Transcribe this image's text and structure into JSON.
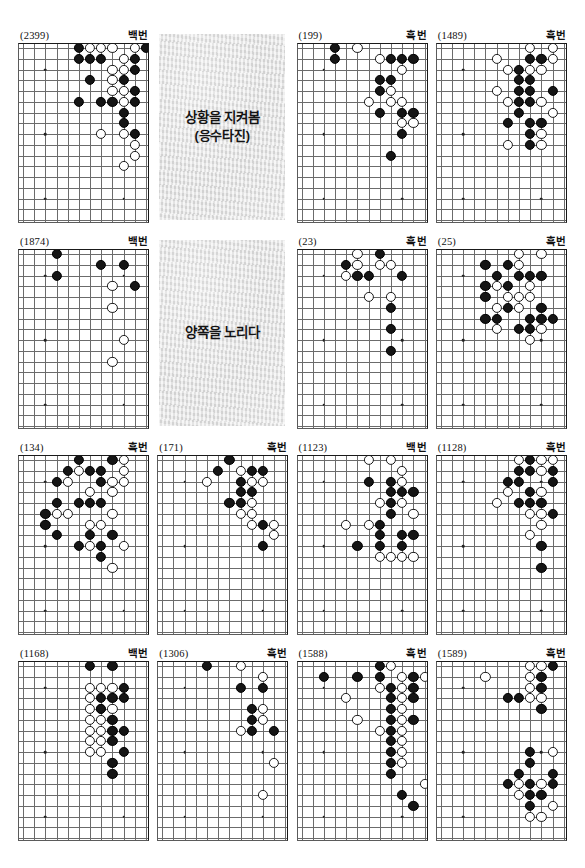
{
  "sheet": {
    "label_black_turn": "흑번",
    "label_white_turn": "백번",
    "board": {
      "cols": 12,
      "rows": 17
    }
  },
  "captions": [
    {
      "line1": "상황을 지켜봄",
      "line2": "(응수타진)"
    },
    {
      "line1": "양쪽을 노리다",
      "line2": ""
    }
  ],
  "panels": [
    {
      "number": "(2399)",
      "turn": "백번",
      "black": [
        [
          5,
          0
        ],
        [
          5,
          1
        ],
        [
          6,
          1
        ],
        [
          7,
          1
        ],
        [
          11,
          0
        ],
        [
          10,
          1
        ],
        [
          10,
          2
        ],
        [
          6,
          3
        ],
        [
          9,
          3
        ],
        [
          10,
          4
        ],
        [
          5,
          5
        ],
        [
          7,
          5
        ],
        [
          8,
          5
        ],
        [
          10,
          5
        ],
        [
          9,
          6
        ],
        [
          9,
          7
        ],
        [
          10,
          8
        ]
      ],
      "white": [
        [
          6,
          0
        ],
        [
          7,
          0
        ],
        [
          8,
          0
        ],
        [
          10,
          0
        ],
        [
          9,
          1
        ],
        [
          8,
          2
        ],
        [
          9,
          2
        ],
        [
          8,
          3
        ],
        [
          8,
          4
        ],
        [
          9,
          4
        ],
        [
          9,
          5
        ],
        [
          9,
          8
        ],
        [
          10,
          9
        ],
        [
          10,
          10
        ],
        [
          9,
          11
        ],
        [
          7,
          8
        ]
      ]
    },
    {
      "number": "(199)",
      "turn": "흑번",
      "black": [
        [
          3,
          0
        ],
        [
          3,
          1
        ],
        [
          8,
          1
        ],
        [
          9,
          1
        ],
        [
          10,
          1
        ],
        [
          7,
          3
        ],
        [
          8,
          3
        ],
        [
          7,
          4
        ],
        [
          7,
          6
        ],
        [
          9,
          6
        ],
        [
          10,
          6
        ],
        [
          9,
          8
        ],
        [
          8,
          10
        ]
      ],
      "white": [
        [
          5,
          0
        ],
        [
          7,
          1
        ],
        [
          9,
          2
        ],
        [
          8,
          4
        ],
        [
          8,
          5
        ],
        [
          9,
          5
        ],
        [
          6,
          5
        ],
        [
          9,
          7
        ],
        [
          10,
          7
        ]
      ]
    },
    {
      "number": "(1489)",
      "turn": "흑번",
      "black": [
        [
          8,
          1
        ],
        [
          9,
          1
        ],
        [
          7,
          2
        ],
        [
          7,
          3
        ],
        [
          8,
          3
        ],
        [
          7,
          4
        ],
        [
          8,
          4
        ],
        [
          10,
          4
        ],
        [
          7,
          5
        ],
        [
          8,
          5
        ],
        [
          7,
          6
        ],
        [
          6,
          7
        ],
        [
          8,
          7
        ],
        [
          9,
          7
        ],
        [
          8,
          8
        ],
        [
          8,
          9
        ]
      ],
      "white": [
        [
          8,
          0
        ],
        [
          10,
          0
        ],
        [
          5,
          1
        ],
        [
          10,
          1
        ],
        [
          6,
          2
        ],
        [
          8,
          2
        ],
        [
          9,
          2
        ],
        [
          5,
          4
        ],
        [
          6,
          5
        ],
        [
          9,
          5
        ],
        [
          10,
          6
        ],
        [
          9,
          8
        ],
        [
          6,
          9
        ],
        [
          9,
          9
        ]
      ]
    },
    {
      "number": "(1874)",
      "turn": "백번",
      "black": [
        [
          3,
          0
        ],
        [
          3,
          2
        ],
        [
          7,
          1
        ],
        [
          9,
          1
        ],
        [
          10,
          3
        ]
      ],
      "white": [
        [
          8,
          3
        ],
        [
          8,
          5
        ],
        [
          9,
          8
        ],
        [
          8,
          10
        ]
      ]
    },
    {
      "number": "(23)",
      "turn": "흑번",
      "black": [
        [
          4,
          1
        ],
        [
          7,
          0
        ],
        [
          5,
          2
        ],
        [
          6,
          2
        ],
        [
          9,
          2
        ],
        [
          8,
          5
        ],
        [
          8,
          7
        ],
        [
          8,
          9
        ]
      ],
      "white": [
        [
          5,
          0
        ],
        [
          5,
          1
        ],
        [
          7,
          1
        ],
        [
          8,
          1
        ],
        [
          4,
          2
        ],
        [
          6,
          4
        ],
        [
          8,
          4
        ]
      ]
    },
    {
      "number": "(25)",
      "turn": "흑번",
      "black": [
        [
          4,
          1
        ],
        [
          6,
          1
        ],
        [
          5,
          2
        ],
        [
          7,
          2
        ],
        [
          8,
          2
        ],
        [
          9,
          2
        ],
        [
          4,
          3
        ],
        [
          6,
          3
        ],
        [
          4,
          4
        ],
        [
          6,
          5
        ],
        [
          9,
          5
        ],
        [
          4,
          6
        ],
        [
          5,
          6
        ],
        [
          8,
          6
        ],
        [
          9,
          6
        ],
        [
          10,
          6
        ],
        [
          7,
          7
        ],
        [
          8,
          7
        ]
      ],
      "white": [
        [
          7,
          0
        ],
        [
          9,
          0
        ],
        [
          7,
          1
        ],
        [
          5,
          3
        ],
        [
          6,
          4
        ],
        [
          7,
          4
        ],
        [
          8,
          4
        ],
        [
          8,
          3
        ],
        [
          5,
          5
        ],
        [
          7,
          5
        ],
        [
          5,
          7
        ],
        [
          9,
          7
        ],
        [
          8,
          8
        ]
      ]
    },
    {
      "number": "(134)",
      "turn": "흑번",
      "black": [
        [
          5,
          0
        ],
        [
          8,
          0
        ],
        [
          4,
          1
        ],
        [
          6,
          1
        ],
        [
          7,
          1
        ],
        [
          3,
          2
        ],
        [
          7,
          2
        ],
        [
          3,
          4
        ],
        [
          5,
          4
        ],
        [
          6,
          4
        ],
        [
          7,
          4
        ],
        [
          2,
          5
        ],
        [
          2,
          6
        ],
        [
          3,
          7
        ],
        [
          6,
          7
        ],
        [
          8,
          7
        ],
        [
          5,
          8
        ],
        [
          7,
          8
        ],
        [
          7,
          9
        ]
      ],
      "white": [
        [
          9,
          0
        ],
        [
          5,
          1
        ],
        [
          9,
          1
        ],
        [
          4,
          2
        ],
        [
          8,
          2
        ],
        [
          9,
          2
        ],
        [
          8,
          3
        ],
        [
          6,
          3
        ],
        [
          3,
          5
        ],
        [
          4,
          5
        ],
        [
          8,
          5
        ],
        [
          6,
          6
        ],
        [
          7,
          6
        ],
        [
          6,
          8
        ],
        [
          9,
          8
        ],
        [
          8,
          10
        ]
      ]
    },
    {
      "number": "(171)",
      "turn": "흑번",
      "black": [
        [
          6,
          0
        ],
        [
          5,
          1
        ],
        [
          8,
          1
        ],
        [
          9,
          1
        ],
        [
          7,
          2
        ],
        [
          7,
          3
        ],
        [
          8,
          3
        ],
        [
          6,
          4
        ],
        [
          7,
          4
        ],
        [
          9,
          6
        ],
        [
          9,
          8
        ]
      ],
      "white": [
        [
          7,
          1
        ],
        [
          4,
          2
        ],
        [
          8,
          2
        ],
        [
          9,
          2
        ],
        [
          8,
          4
        ],
        [
          8,
          5
        ],
        [
          7,
          5
        ],
        [
          8,
          6
        ],
        [
          10,
          6
        ],
        [
          10,
          7
        ]
      ]
    },
    {
      "number": "(1123)",
      "turn": "백번",
      "black": [
        [
          6,
          2
        ],
        [
          8,
          2
        ],
        [
          8,
          3
        ],
        [
          9,
          3
        ],
        [
          10,
          3
        ],
        [
          8,
          4
        ],
        [
          8,
          5
        ],
        [
          7,
          6
        ],
        [
          7,
          7
        ],
        [
          9,
          7
        ],
        [
          10,
          7
        ],
        [
          5,
          8
        ],
        [
          7,
          8
        ],
        [
          9,
          8
        ]
      ],
      "white": [
        [
          6,
          0
        ],
        [
          8,
          0
        ],
        [
          9,
          1
        ],
        [
          9,
          2
        ],
        [
          7,
          4
        ],
        [
          9,
          4
        ],
        [
          6,
          6
        ],
        [
          4,
          6
        ],
        [
          10,
          5
        ],
        [
          8,
          9
        ],
        [
          9,
          9
        ],
        [
          10,
          9
        ],
        [
          7,
          9
        ]
      ]
    },
    {
      "number": "(1128)",
      "turn": "흑번",
      "black": [
        [
          8,
          0
        ],
        [
          7,
          1
        ],
        [
          8,
          1
        ],
        [
          10,
          1
        ],
        [
          6,
          2
        ],
        [
          7,
          2
        ],
        [
          10,
          2
        ],
        [
          8,
          3
        ],
        [
          7,
          4
        ],
        [
          8,
          4
        ],
        [
          9,
          4
        ],
        [
          10,
          5
        ],
        [
          9,
          8
        ],
        [
          9,
          10
        ]
      ],
      "white": [
        [
          7,
          0
        ],
        [
          9,
          0
        ],
        [
          10,
          0
        ],
        [
          9,
          1
        ],
        [
          6,
          3
        ],
        [
          9,
          3
        ],
        [
          5,
          4
        ],
        [
          8,
          5
        ],
        [
          9,
          5
        ],
        [
          9,
          6
        ],
        [
          8,
          7
        ]
      ]
    },
    {
      "number": "(1168)",
      "turn": "백번",
      "black": [
        [
          6,
          0
        ],
        [
          8,
          0
        ],
        [
          9,
          2
        ],
        [
          7,
          3
        ],
        [
          8,
          3
        ],
        [
          9,
          3
        ],
        [
          7,
          4
        ],
        [
          8,
          5
        ],
        [
          8,
          6
        ],
        [
          9,
          6
        ],
        [
          8,
          7
        ],
        [
          9,
          8
        ],
        [
          8,
          9
        ],
        [
          8,
          10
        ]
      ],
      "white": [
        [
          6,
          2
        ],
        [
          7,
          2
        ],
        [
          8,
          2
        ],
        [
          6,
          3
        ],
        [
          6,
          4
        ],
        [
          7,
          4
        ],
        [
          8,
          4
        ],
        [
          6,
          5
        ],
        [
          7,
          5
        ],
        [
          6,
          6
        ],
        [
          7,
          6
        ],
        [
          6,
          7
        ],
        [
          7,
          7
        ],
        [
          6,
          8
        ],
        [
          7,
          8
        ]
      ]
    },
    {
      "number": "(1306)",
      "turn": "흑번",
      "black": [
        [
          4,
          0
        ],
        [
          7,
          2
        ],
        [
          9,
          2
        ],
        [
          8,
          4
        ],
        [
          8,
          5
        ],
        [
          8,
          6
        ],
        [
          10,
          6
        ]
      ],
      "white": [
        [
          7,
          0
        ],
        [
          9,
          1
        ],
        [
          9,
          4
        ],
        [
          9,
          5
        ],
        [
          7,
          6
        ],
        [
          10,
          9
        ],
        [
          9,
          12
        ]
      ]
    },
    {
      "number": "(1588)",
      "turn": "흑번",
      "black": [
        [
          2,
          1
        ],
        [
          5,
          1
        ],
        [
          7,
          0
        ],
        [
          7,
          1
        ],
        [
          8,
          2
        ],
        [
          8,
          3
        ],
        [
          8,
          4
        ],
        [
          8,
          5
        ],
        [
          10,
          1
        ],
        [
          10,
          2
        ],
        [
          10,
          3
        ],
        [
          10,
          5
        ],
        [
          8,
          6
        ],
        [
          8,
          7
        ],
        [
          8,
          8
        ],
        [
          8,
          9
        ],
        [
          8,
          10
        ],
        [
          9,
          12
        ],
        [
          10,
          13
        ]
      ],
      "white": [
        [
          8,
          0
        ],
        [
          7,
          2
        ],
        [
          9,
          1
        ],
        [
          9,
          2
        ],
        [
          11,
          1
        ],
        [
          4,
          3
        ],
        [
          9,
          3
        ],
        [
          5,
          5
        ],
        [
          9,
          4
        ],
        [
          9,
          5
        ],
        [
          7,
          6
        ],
        [
          9,
          6
        ],
        [
          9,
          7
        ],
        [
          9,
          8
        ],
        [
          9,
          9
        ],
        [
          11,
          11
        ]
      ]
    },
    {
      "number": "(1589)",
      "turn": "흑번",
      "black": [
        [
          10,
          0
        ],
        [
          9,
          1
        ],
        [
          9,
          2
        ],
        [
          6,
          3
        ],
        [
          7,
          3
        ],
        [
          9,
          4
        ],
        [
          8,
          8
        ],
        [
          8,
          9
        ],
        [
          7,
          10
        ],
        [
          10,
          10
        ],
        [
          6,
          11
        ],
        [
          8,
          11
        ],
        [
          10,
          11
        ],
        [
          8,
          12
        ],
        [
          9,
          12
        ],
        [
          8,
          13
        ]
      ],
      "white": [
        [
          8,
          0
        ],
        [
          9,
          0
        ],
        [
          4,
          1
        ],
        [
          8,
          1
        ],
        [
          8,
          2
        ],
        [
          8,
          3
        ],
        [
          9,
          3
        ],
        [
          10,
          8
        ],
        [
          7,
          11
        ],
        [
          9,
          11
        ],
        [
          7,
          12
        ],
        [
          10,
          13
        ],
        [
          9,
          14
        ],
        [
          8,
          14
        ]
      ]
    }
  ]
}
